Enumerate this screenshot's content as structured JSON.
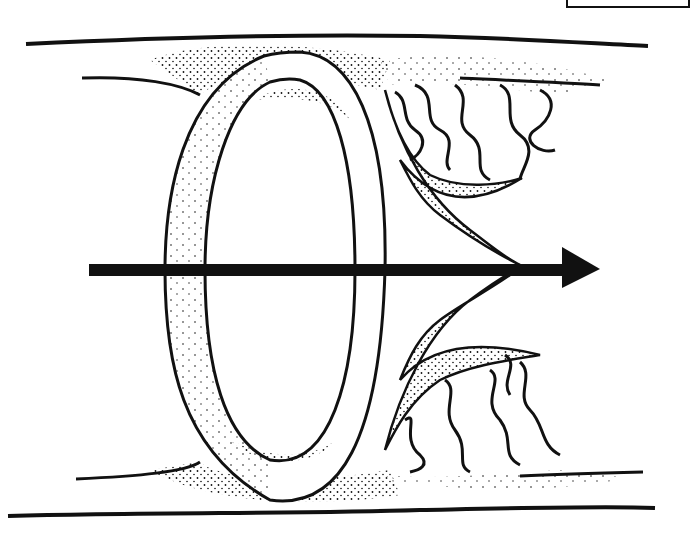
{
  "figure": {
    "arrow_direction": "right",
    "colors": {
      "ink": "#111111",
      "background": "#ffffff"
    },
    "elements": [
      "tube-top-wall",
      "tube-bottom-wall",
      "vortex-ring",
      "direction-arrow",
      "upper-wake-lobe",
      "lower-wake-lobe",
      "upper-wavy-filaments",
      "lower-wavy-filaments"
    ]
  }
}
